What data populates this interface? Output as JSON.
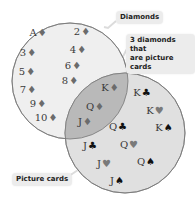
{
  "diagram": {
    "type": "venn",
    "sets": [
      {
        "id": "diamonds",
        "label": "Diamonds",
        "fill": "#efefef",
        "stroke": "#777777"
      },
      {
        "id": "picture",
        "label": "Picture cards",
        "fill": "#e0e0e0",
        "stroke": "#777777"
      }
    ],
    "intersection": {
      "label": "3 diamonds that are picture cards",
      "label_line1": "3 diamonds that",
      "label_line2": "are picture cards",
      "fill": "#b9b9b9"
    },
    "callouts": {
      "diamonds": "Diamonds",
      "intersection_line1": "3 diamonds that",
      "intersection_line2": "are picture cards",
      "picture": "Picture cards"
    },
    "cards": [
      {
        "rank": "A",
        "suit": "♦",
        "suit_name": "diamond",
        "region": "diamonds",
        "x": 38,
        "y": 33
      },
      {
        "rank": "2",
        "suit": "♦",
        "suit_name": "diamond",
        "region": "diamonds",
        "x": 82,
        "y": 32
      },
      {
        "rank": "3",
        "suit": "♦",
        "suit_name": "diamond",
        "region": "diamonds",
        "x": 28,
        "y": 53
      },
      {
        "rank": "4",
        "suit": "♦",
        "suit_name": "diamond",
        "region": "diamonds",
        "x": 78,
        "y": 50
      },
      {
        "rank": "5",
        "suit": "♦",
        "suit_name": "diamond",
        "region": "diamonds",
        "x": 27,
        "y": 72
      },
      {
        "rank": "6",
        "suit": "♦",
        "suit_name": "diamond",
        "region": "diamonds",
        "x": 73,
        "y": 66
      },
      {
        "rank": "7",
        "suit": "♦",
        "suit_name": "diamond",
        "region": "diamonds",
        "x": 28,
        "y": 90
      },
      {
        "rank": "8",
        "suit": "♦",
        "suit_name": "diamond",
        "region": "diamonds",
        "x": 70,
        "y": 81
      },
      {
        "rank": "9",
        "suit": "♦",
        "suit_name": "diamond",
        "region": "diamonds",
        "x": 38,
        "y": 104
      },
      {
        "rank": "10",
        "suit": "♦",
        "suit_name": "diamond",
        "region": "diamonds",
        "x": 46,
        "y": 118
      },
      {
        "rank": "K",
        "suit": "♦",
        "suit_name": "diamond",
        "region": "intersection",
        "x": 110,
        "y": 88
      },
      {
        "rank": "Q",
        "suit": "♦",
        "suit_name": "diamond",
        "region": "intersection",
        "x": 95,
        "y": 107
      },
      {
        "rank": "J",
        "suit": "♦",
        "suit_name": "diamond",
        "region": "intersection",
        "x": 85,
        "y": 122
      },
      {
        "rank": "K",
        "suit": "♣",
        "suit_name": "club",
        "region": "picture",
        "x": 142,
        "y": 93
      },
      {
        "rank": "K",
        "suit": "♥",
        "suit_name": "heart",
        "region": "picture",
        "x": 155,
        "y": 111
      },
      {
        "rank": "K",
        "suit": "♠",
        "suit_name": "spade",
        "region": "picture",
        "x": 164,
        "y": 128
      },
      {
        "rank": "Q",
        "suit": "♣",
        "suit_name": "club",
        "region": "picture",
        "x": 118,
        "y": 127
      },
      {
        "rank": "Q",
        "suit": "♥",
        "suit_name": "heart",
        "region": "picture",
        "x": 129,
        "y": 145
      },
      {
        "rank": "Q",
        "suit": "♠",
        "suit_name": "spade",
        "region": "picture",
        "x": 146,
        "y": 162
      },
      {
        "rank": "J",
        "suit": "♣",
        "suit_name": "club",
        "region": "picture",
        "x": 90,
        "y": 146
      },
      {
        "rank": "J",
        "suit": "♥",
        "suit_name": "heart",
        "region": "picture",
        "x": 104,
        "y": 164
      },
      {
        "rank": "J",
        "suit": "♠",
        "suit_name": "spade",
        "region": "picture",
        "x": 117,
        "y": 181
      }
    ]
  }
}
